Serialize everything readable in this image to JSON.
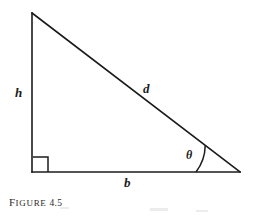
{
  "figure": {
    "caption_lead": "F",
    "caption_rest": "IGURE",
    "caption_number": "4.5",
    "background_color": "#ffffff",
    "ink_color": "#1b1b1b"
  },
  "diagram": {
    "type": "right-triangle",
    "vertices": {
      "apex": {
        "x": 32,
        "y": 13
      },
      "right_angle": {
        "x": 32,
        "y": 172
      },
      "theta_vertex": {
        "x": 240,
        "y": 172
      }
    },
    "stroke_width": 1.6,
    "right_angle_marker": {
      "name": "right-angle-square",
      "size": 15,
      "x": 33,
      "y": 157
    },
    "angle_arc": {
      "name": "theta-arc",
      "center": {
        "x": 240,
        "y": 172
      },
      "radius": 44,
      "start": {
        "x": 196,
        "y": 172
      },
      "end": {
        "x": 205,
        "y": 146
      }
    }
  },
  "labels": {
    "height": "h",
    "hypotenuse": "d",
    "base": "b",
    "angle": "θ"
  }
}
